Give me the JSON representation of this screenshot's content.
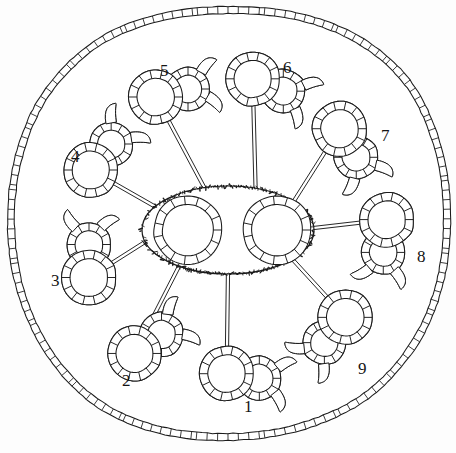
{
  "figure": {
    "type": "line-drawing",
    "background_color": "#fdfdfd",
    "stroke_color": "#1b1b1b",
    "cell_fill": "#ffffff"
  },
  "outer_boundary": {
    "name": "epidermis-ring",
    "description": "rounded polygonal outline built from small rectangular cells",
    "cell_count": 150,
    "stroke": "#1b1b1b"
  },
  "center": {
    "name": "central-ellipse",
    "description": "textured stippled ellipse enclosing two cell rings",
    "cx": 228,
    "cy": 230,
    "rx": 86,
    "ry": 44,
    "rings": [
      {
        "name": "central-ring-left",
        "cx": 188,
        "cy": 230,
        "r": 30,
        "cell_count": 15
      },
      {
        "name": "central-ring-right",
        "cx": 277,
        "cy": 230,
        "r": 30,
        "cell_count": 15
      }
    ]
  },
  "satellites": [
    {
      "id": 1,
      "label": "1",
      "angle": 90,
      "cx": 243,
      "cy": 376,
      "rot": 8,
      "horns": 2,
      "label_x": 244,
      "label_y": 398
    },
    {
      "id": 2,
      "label": "2",
      "angle": 126,
      "cx": 148,
      "cy": 344,
      "rot": -35,
      "horns": 2,
      "label_x": 122,
      "label_y": 372
    },
    {
      "id": 3,
      "label": "3",
      "angle": 167,
      "cx": 89,
      "cy": 261,
      "rot": -90,
      "horns": 2,
      "label_x": 51,
      "label_y": 272
    },
    {
      "id": 4,
      "label": "4",
      "angle": 211,
      "cx": 101,
      "cy": 157,
      "rot": -52,
      "horns": 2,
      "label_x": 71,
      "label_y": 148
    },
    {
      "id": 5,
      "label": "5",
      "angle": 254,
      "cx": 172,
      "cy": 93,
      "rot": -14,
      "horns": 2,
      "label_x": 160,
      "label_y": 62
    },
    {
      "id": 6,
      "label": "6",
      "angle": 290,
      "cx": 268,
      "cy": 85,
      "rot": 22,
      "horns": 2,
      "label_x": 283,
      "label_y": 59
    },
    {
      "id": 7,
      "label": "7",
      "angle": 322,
      "cx": 348,
      "cy": 143,
      "rot": 60,
      "horns": 2,
      "label_x": 381,
      "label_y": 127
    },
    {
      "id": 8,
      "label": "8",
      "angle": 358,
      "cx": 385,
      "cy": 236,
      "rot": 96,
      "horns": 2,
      "label_x": 417,
      "label_y": 248
    },
    {
      "id": 9,
      "label": "9",
      "angle": 40,
      "cx": 335,
      "cy": 330,
      "rot": 130,
      "horns": 2,
      "label_x": 358,
      "label_y": 360
    }
  ],
  "connectors": {
    "name": "vascular-strand-lines",
    "style": "double-line",
    "count": 9,
    "gap_px": 3.2
  },
  "satellite_shape": {
    "description": "figure-eight of two cell rings",
    "big_ring_r": 23,
    "small_ring_r": 18,
    "big_cell_count": 14,
    "small_cell_count": 12
  }
}
